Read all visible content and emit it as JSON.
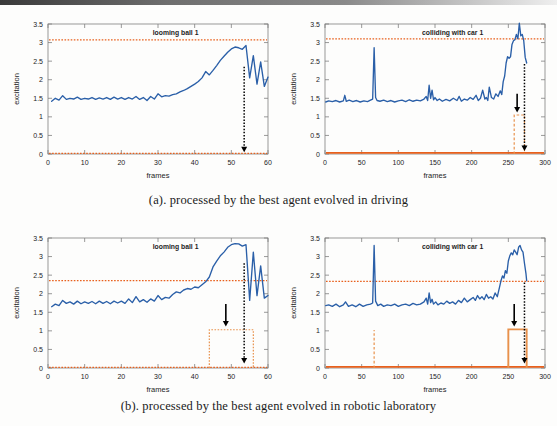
{
  "figure": {
    "panels": [
      {
        "id": "panel-a",
        "caption": "(a). processed by the best agent evolved in driving",
        "charts": [
          "chart-a-left",
          "chart-a-right"
        ]
      },
      {
        "id": "panel-b",
        "caption": "(b). processed by the best agent evolved in robotic laboratory",
        "charts": [
          "chart-b-left",
          "chart-b-right"
        ]
      }
    ]
  },
  "colors": {
    "signal": "#2a5fa8",
    "threshold": "#e8601c",
    "baseline": "#e8601c",
    "pulse": "#e8914b",
    "arrow": "#000000",
    "axis": "#7f7f7f",
    "text": "#1c1c1c",
    "background": "#fdfdfc"
  },
  "chart_data": [
    {
      "id": "chart-a-left",
      "type": "line",
      "title": "looming ball 1",
      "xlabel": "frames",
      "ylabel": "excitation",
      "xlim": [
        0,
        60
      ],
      "ylim": [
        0,
        3.5
      ],
      "xticks": [
        0,
        10,
        20,
        30,
        40,
        50,
        60
      ],
      "xticklabels": [
        "0",
        "10",
        "20",
        "30",
        "40",
        "50",
        "60"
      ],
      "yticks": [
        0,
        0.5,
        1,
        1.5,
        2,
        2.5,
        3,
        3.5
      ],
      "yticklabels": [
        "0",
        "0.5",
        "1",
        "1.5",
        "2",
        "2.5",
        "3",
        "3.5"
      ],
      "grid": false,
      "legend": "none",
      "series": [
        {
          "name": "excitation",
          "color": "#2a5fa8",
          "style": "solid",
          "x": [
            1,
            2,
            3,
            4,
            5,
            6,
            7,
            8,
            9,
            10,
            11,
            12,
            13,
            14,
            15,
            16,
            17,
            18,
            19,
            20,
            21,
            22,
            23,
            24,
            25,
            26,
            27,
            28,
            29,
            30,
            31,
            32,
            33,
            34,
            35,
            36,
            37,
            38,
            39,
            40,
            41,
            42,
            43,
            44,
            45,
            46,
            47,
            48,
            49,
            50,
            51,
            52,
            53,
            54,
            55,
            56,
            57,
            58,
            59,
            60
          ],
          "y": [
            1.42,
            1.5,
            1.45,
            1.57,
            1.47,
            1.5,
            1.48,
            1.53,
            1.47,
            1.5,
            1.48,
            1.52,
            1.47,
            1.51,
            1.48,
            1.52,
            1.47,
            1.53,
            1.48,
            1.52,
            1.47,
            1.52,
            1.48,
            1.55,
            1.47,
            1.52,
            1.44,
            1.55,
            1.48,
            1.62,
            1.54,
            1.57,
            1.56,
            1.6,
            1.62,
            1.67,
            1.71,
            1.76,
            1.82,
            1.88,
            1.95,
            2.05,
            2.22,
            2.13,
            2.25,
            2.38,
            2.52,
            2.63,
            2.74,
            2.83,
            2.88,
            2.86,
            2.82,
            2.92,
            2.05,
            2.65,
            1.88,
            2.48,
            1.82,
            2.07
          ]
        }
      ],
      "threshold_lines": [
        {
          "name": "upper-threshold",
          "value": 3.07,
          "color": "#e8601c",
          "style": "dotted"
        },
        {
          "name": "baseline",
          "value": 0.02,
          "color": "#e8601c",
          "style": "dotted"
        }
      ],
      "step_pulses": [],
      "arrows": [
        {
          "name": "dotted-event-arrow",
          "x": 53.5,
          "y_from": 2.35,
          "y_to": 0.05,
          "style": "dotted",
          "color": "#000000"
        }
      ]
    },
    {
      "id": "chart-a-right",
      "type": "line",
      "title": "colliding with car 1",
      "xlabel": "frames",
      "ylabel": "excitation",
      "xlim": [
        0,
        300
      ],
      "ylim": [
        0,
        3.5
      ],
      "xticks": [
        0,
        50,
        100,
        150,
        200,
        250,
        300
      ],
      "xticklabels": [
        "0",
        "50",
        "100",
        "150",
        "200",
        "250",
        "300"
      ],
      "yticks": [
        0,
        0.5,
        1,
        1.5,
        2,
        2.5,
        3,
        3.5
      ],
      "yticklabels": [
        "0",
        "0.5",
        "1",
        "1.5",
        "2",
        "2.5",
        "3",
        "3.5"
      ],
      "grid": false,
      "legend": "none",
      "series": [
        {
          "name": "excitation",
          "color": "#2a5fa8",
          "style": "solid",
          "x": [
            1,
            5,
            10,
            15,
            20,
            25,
            27,
            29,
            33,
            38,
            43,
            48,
            53,
            58,
            62,
            65,
            67,
            69,
            71,
            75,
            80,
            85,
            90,
            95,
            100,
            105,
            110,
            115,
            120,
            125,
            130,
            135,
            138,
            140,
            142,
            144,
            146,
            148,
            150,
            153,
            156,
            160,
            165,
            170,
            175,
            180,
            183,
            186,
            190,
            194,
            198,
            202,
            206,
            209,
            212,
            215,
            218,
            220,
            222,
            224,
            227,
            230,
            233,
            236,
            239,
            241,
            243,
            245,
            247,
            249,
            251,
            253,
            255,
            257,
            259,
            261,
            263,
            265,
            267,
            269,
            271,
            273,
            275
          ],
          "y": [
            1.4,
            1.43,
            1.41,
            1.44,
            1.4,
            1.43,
            1.58,
            1.42,
            1.45,
            1.41,
            1.44,
            1.4,
            1.43,
            1.41,
            1.45,
            1.48,
            2.86,
            1.52,
            1.44,
            1.42,
            1.45,
            1.41,
            1.44,
            1.4,
            1.43,
            1.45,
            1.41,
            1.46,
            1.42,
            1.45,
            1.43,
            1.48,
            1.55,
            1.44,
            1.85,
            1.5,
            1.72,
            1.46,
            1.52,
            1.44,
            1.48,
            1.42,
            1.47,
            1.43,
            1.5,
            1.44,
            1.55,
            1.42,
            1.48,
            1.45,
            1.52,
            1.47,
            1.58,
            1.44,
            1.5,
            1.72,
            1.48,
            1.52,
            1.44,
            1.8,
            1.52,
            1.48,
            1.62,
            1.55,
            1.7,
            1.6,
            1.95,
            2.1,
            2.45,
            2.62,
            2.58,
            2.62,
            2.95,
            3.05,
            3.08,
            3.22,
            3.1,
            3.52,
            3.18,
            3.22,
            3.05,
            2.6,
            2.45
          ]
        }
      ],
      "threshold_lines": [
        {
          "name": "upper-threshold",
          "value": 3.1,
          "color": "#e8601c",
          "style": "dotted"
        },
        {
          "name": "baseline",
          "value": 0.03,
          "color": "#e8601c",
          "style": "solid"
        }
      ],
      "step_pulses": [
        {
          "name": "response-pulse",
          "x_start": 258,
          "x_end": 272,
          "level": 1.05,
          "color": "#e8914b",
          "style": "dashed"
        }
      ],
      "arrows": [
        {
          "name": "solid-event-arrow",
          "x": 262,
          "y_from": 1.62,
          "y_to": 1.12,
          "style": "solid",
          "color": "#000000"
        },
        {
          "name": "dotted-event-arrow",
          "x": 272,
          "y_from": 2.42,
          "y_to": 0.08,
          "style": "dotted",
          "color": "#000000"
        }
      ]
    },
    {
      "id": "chart-b-left",
      "type": "line",
      "title": "looming ball 1",
      "xlabel": "frames",
      "ylabel": "excitation",
      "xlim": [
        0,
        60
      ],
      "ylim": [
        0,
        3.5
      ],
      "xticks": [
        0,
        10,
        20,
        30,
        40,
        50,
        60
      ],
      "xticklabels": [
        "0",
        "10",
        "20",
        "30",
        "40",
        "50",
        "60"
      ],
      "yticks": [
        0,
        0.5,
        1,
        1.5,
        2,
        2.5,
        3,
        3.5
      ],
      "yticklabels": [
        "0",
        "0.5",
        "1",
        "1.5",
        "2",
        "2.5",
        "3",
        "3.5"
      ],
      "grid": false,
      "legend": "none",
      "series": [
        {
          "name": "excitation",
          "color": "#2a5fa8",
          "style": "solid",
          "x": [
            1,
            2,
            3,
            4,
            5,
            6,
            7,
            8,
            9,
            10,
            11,
            12,
            13,
            14,
            15,
            16,
            17,
            18,
            19,
            20,
            21,
            22,
            23,
            24,
            25,
            26,
            27,
            28,
            29,
            30,
            31,
            32,
            33,
            34,
            35,
            36,
            37,
            38,
            39,
            40,
            41,
            42,
            43,
            44,
            45,
            46,
            47,
            48,
            49,
            50,
            51,
            52,
            53,
            54,
            55,
            56,
            57,
            58,
            59,
            60
          ],
          "y": [
            1.65,
            1.72,
            1.68,
            1.82,
            1.74,
            1.78,
            1.72,
            1.8,
            1.73,
            1.78,
            1.74,
            1.79,
            1.73,
            1.8,
            1.74,
            1.79,
            1.73,
            1.8,
            1.75,
            1.8,
            1.74,
            1.86,
            1.76,
            1.92,
            1.78,
            1.84,
            1.77,
            1.86,
            1.8,
            1.95,
            1.84,
            1.9,
            1.88,
            1.98,
            2.05,
            2.02,
            2.1,
            2.14,
            2.12,
            2.18,
            2.16,
            2.24,
            2.32,
            2.45,
            2.72,
            2.88,
            3.02,
            3.12,
            3.25,
            3.32,
            3.35,
            3.34,
            3.28,
            3.32,
            1.82,
            3.12,
            1.95,
            2.75,
            1.88,
            1.95
          ]
        }
      ],
      "threshold_lines": [
        {
          "name": "upper-threshold",
          "value": 2.35,
          "color": "#e8601c",
          "style": "dotted"
        },
        {
          "name": "baseline",
          "value": 0.02,
          "color": "#e8601c",
          "style": "dotted"
        }
      ],
      "step_pulses": [
        {
          "name": "response-pulse",
          "x_start": 44,
          "x_end": 56,
          "level": 1.03,
          "color": "#e8914b",
          "style": "dotted"
        }
      ],
      "arrows": [
        {
          "name": "solid-event-arrow",
          "x": 48.5,
          "y_from": 1.72,
          "y_to": 1.12,
          "style": "solid",
          "color": "#000000"
        },
        {
          "name": "dotted-event-arrow",
          "x": 53.5,
          "y_from": 2.82,
          "y_to": 0.12,
          "style": "dotted",
          "color": "#000000"
        }
      ]
    },
    {
      "id": "chart-b-right",
      "type": "line",
      "title": "colliding with car 1",
      "xlabel": "frames",
      "ylabel": "excitation",
      "xlim": [
        0,
        300
      ],
      "ylim": [
        0,
        3.5
      ],
      "xticks": [
        0,
        50,
        100,
        150,
        200,
        250,
        300
      ],
      "xticklabels": [
        "0",
        "50",
        "100",
        "150",
        "200",
        "250",
        "300"
      ],
      "yticks": [
        0,
        0.5,
        1,
        1.5,
        2,
        2.5,
        3,
        3.5
      ],
      "yticklabels": [
        "0",
        "0.5",
        "1",
        "1.5",
        "2",
        "2.5",
        "3",
        "3.5"
      ],
      "grid": false,
      "legend": "none",
      "series": [
        {
          "name": "excitation",
          "color": "#2a5fa8",
          "style": "solid",
          "x": [
            1,
            5,
            10,
            15,
            20,
            25,
            28,
            32,
            37,
            42,
            47,
            52,
            57,
            62,
            65,
            67,
            69,
            72,
            76,
            80,
            85,
            90,
            95,
            100,
            105,
            110,
            115,
            120,
            125,
            130,
            135,
            138,
            140,
            142,
            144,
            146,
            148,
            151,
            154,
            158,
            162,
            166,
            170,
            174,
            178,
            182,
            186,
            190,
            194,
            198,
            202,
            205,
            208,
            211,
            214,
            217,
            220,
            223,
            226,
            229,
            232,
            235,
            238,
            240,
            242,
            244,
            246,
            248,
            250,
            252,
            254,
            256,
            258,
            260,
            262,
            264,
            266,
            268,
            270,
            272,
            274,
            275
          ],
          "y": [
            1.68,
            1.7,
            1.66,
            1.72,
            1.65,
            1.7,
            1.78,
            1.66,
            1.7,
            1.65,
            1.72,
            1.66,
            1.7,
            1.72,
            1.75,
            3.3,
            1.8,
            1.68,
            1.72,
            1.66,
            1.7,
            1.68,
            1.72,
            1.66,
            1.7,
            1.72,
            1.68,
            1.74,
            1.7,
            1.72,
            1.78,
            1.88,
            1.72,
            2.02,
            1.76,
            1.85,
            1.72,
            1.78,
            1.7,
            1.75,
            1.72,
            1.8,
            1.74,
            1.78,
            1.72,
            1.82,
            1.76,
            1.88,
            1.78,
            1.84,
            1.9,
            1.82,
            1.95,
            1.86,
            1.92,
            1.84,
            1.98,
            1.88,
            1.92,
            1.86,
            2.02,
            1.92,
            2.18,
            2.35,
            2.48,
            2.42,
            2.62,
            2.55,
            2.88,
            3.02,
            3.1,
            3.05,
            3.18,
            3.12,
            3.05,
            3.25,
            3.3,
            3.18,
            3.12,
            2.82,
            2.55,
            2.35
          ]
        }
      ],
      "threshold_lines": [
        {
          "name": "upper-threshold",
          "value": 2.33,
          "color": "#e8601c",
          "style": "dotted"
        },
        {
          "name": "baseline",
          "value": 0.03,
          "color": "#e8601c",
          "style": "solid"
        }
      ],
      "step_pulses": [
        {
          "name": "response-pulse",
          "x_start": 250,
          "x_end": 275,
          "level": 1.04,
          "color": "#e8914b",
          "style": "solid"
        },
        {
          "name": "spike-marker",
          "x_start": 67,
          "x_end": 67,
          "level": 1.02,
          "color": "#e8914b",
          "style": "dashed"
        }
      ],
      "arrows": [
        {
          "name": "solid-event-arrow",
          "x": 258,
          "y_from": 1.72,
          "y_to": 1.12,
          "style": "solid",
          "color": "#000000"
        },
        {
          "name": "dotted-event-arrow",
          "x": 272,
          "y_from": 2.3,
          "y_to": 0.12,
          "style": "dotted",
          "color": "#000000"
        }
      ]
    }
  ]
}
